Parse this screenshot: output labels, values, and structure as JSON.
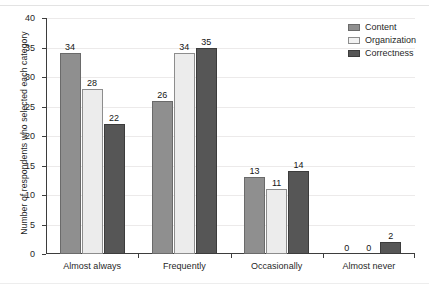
{
  "chart_data": {
    "type": "bar",
    "title": "",
    "xlabel": "",
    "ylabel": "Number of respondents who selected each category",
    "ylim": [
      0,
      40
    ],
    "ytick_step": 5,
    "yticks": [
      "0",
      "5",
      "10",
      "15",
      "20",
      "25",
      "30",
      "35",
      "40"
    ],
    "grid": true,
    "legend_position": "top-right",
    "categories": [
      "Almost always",
      "Frequently",
      "Occasionally",
      "Almost never"
    ],
    "series": [
      {
        "name": "Content",
        "color": "#8f8f8f",
        "values": [
          34,
          26,
          13,
          0
        ]
      },
      {
        "name": "Organization",
        "color": "#ececec",
        "values": [
          28,
          34,
          11,
          0
        ]
      },
      {
        "name": "Correctness",
        "color": "#565656",
        "values": [
          22,
          35,
          14,
          2
        ]
      }
    ],
    "data_labels": [
      [
        "34",
        "28",
        "22"
      ],
      [
        "26",
        "34",
        "35"
      ],
      [
        "13",
        "11",
        "14"
      ],
      [
        "0",
        "0",
        "2"
      ]
    ]
  },
  "legend": {
    "items": [
      {
        "label": "Content",
        "swatch": "legend-swatch-content"
      },
      {
        "label": "Organization",
        "swatch": "legend-swatch-organization"
      },
      {
        "label": "Correctness",
        "swatch": "legend-swatch-correctness"
      }
    ]
  }
}
